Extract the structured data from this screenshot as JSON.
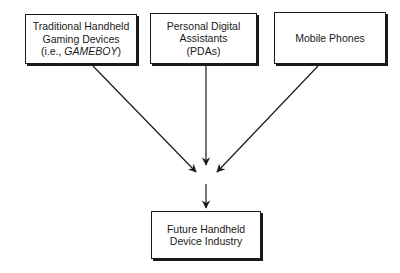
{
  "diagram": {
    "sources": [
      {
        "id": "gaming",
        "lines": [
          "Traditional Handheld",
          "Gaming Devices"
        ],
        "line3_prefix": "(i.e., ",
        "line3_italic": "GAMEBOY",
        "line3_suffix": ")"
      },
      {
        "id": "pda",
        "lines": [
          "Personal Digital",
          "Assistants",
          "(PDAs)"
        ]
      },
      {
        "id": "mobile",
        "lines": [
          "Mobile Phones"
        ]
      }
    ],
    "target": {
      "id": "future",
      "lines": [
        "Future Handheld",
        "Device Industry"
      ]
    },
    "edges": [
      {
        "from": "gaming",
        "to": "convergence"
      },
      {
        "from": "pda",
        "to": "convergence"
      },
      {
        "from": "mobile",
        "to": "convergence"
      },
      {
        "from": "convergence",
        "to": "future"
      }
    ],
    "colors": {
      "stroke": "#1a1a1a",
      "background": "#ffffff"
    }
  }
}
